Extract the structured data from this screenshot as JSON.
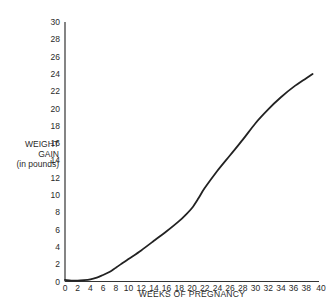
{
  "chart_data": {
    "type": "line",
    "title": "",
    "xlabel": "WEEKS OF PREGNANCY",
    "ylabel": "WEIGHT GAIN (in pounds)",
    "ylabel_lines": [
      "WEIGHT",
      "GAIN",
      "(in pounds)"
    ],
    "xlim": [
      0,
      40
    ],
    "ylim": [
      0,
      30
    ],
    "x_ticks": [
      0,
      2,
      4,
      6,
      8,
      10,
      12,
      14,
      16,
      18,
      20,
      22,
      24,
      26,
      28,
      30,
      32,
      34,
      36,
      38,
      40
    ],
    "y_ticks": [
      0,
      2,
      4,
      6,
      8,
      10,
      12,
      14,
      16,
      18,
      20,
      22,
      24,
      26,
      28,
      30
    ],
    "grid": false,
    "legend": null,
    "series": [
      {
        "name": "Weight gain",
        "color": "#222222",
        "x": [
          0,
          1,
          2,
          3,
          4,
          5,
          6,
          7,
          8,
          9,
          10,
          12,
          14,
          16,
          18,
          19,
          20,
          21,
          22,
          24,
          26,
          28,
          30,
          32,
          34,
          36,
          38,
          39
        ],
        "y": [
          0.2,
          0.1,
          0.1,
          0.15,
          0.25,
          0.45,
          0.75,
          1.1,
          1.6,
          2.1,
          2.6,
          3.6,
          4.7,
          5.8,
          7.0,
          7.7,
          8.5,
          9.6,
          10.8,
          12.8,
          14.6,
          16.4,
          18.3,
          19.9,
          21.3,
          22.5,
          23.5,
          24.0
        ]
      }
    ]
  }
}
